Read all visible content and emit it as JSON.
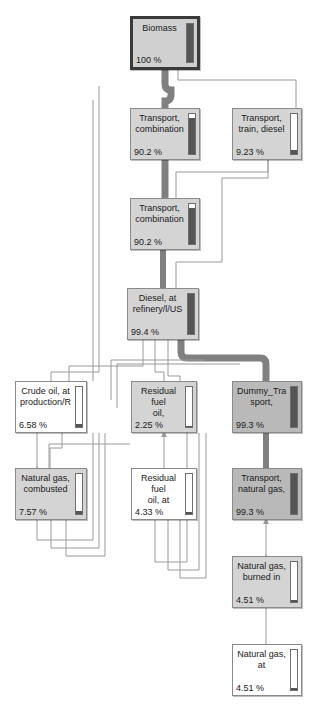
{
  "diagram": {
    "type": "lca-network-tree",
    "unit_suffix": "%",
    "colors": {
      "node_fill": "#d4d4d4",
      "node_fill_dark": "#b9b9b9",
      "node_fill_light": "#ffffff",
      "node_border": "#8a8a8a",
      "root_border": "#3a3a3a",
      "link_thin": "#9a9a9a",
      "link_thick": "#808080",
      "gauge_fill": "#555555",
      "text": "#1a1a1a"
    },
    "nodes": [
      {
        "id": "biomass",
        "line1": "Biomass",
        "line2": "",
        "pct": "100 %",
        "value": 100,
        "x": 130,
        "y": 16,
        "w": 70,
        "h": 54,
        "style": "root",
        "gauge": 100
      },
      {
        "id": "transport-combination-1",
        "line1": "Transport,",
        "line2": "combination",
        "pct": "90.2 %",
        "value": 90.2,
        "x": 130,
        "y": 108,
        "w": 70,
        "h": 52,
        "style": "normal",
        "gauge": 90
      },
      {
        "id": "transport-train-diesel",
        "line1": "Transport,",
        "line2": "train, diesel",
        "pct": "9.23 %",
        "value": 9.23,
        "x": 232,
        "y": 108,
        "w": 70,
        "h": 52,
        "style": "normal",
        "gauge": 9
      },
      {
        "id": "transport-combination-2",
        "line1": "Transport,",
        "line2": "combination",
        "pct": "90.2 %",
        "value": 90.2,
        "x": 130,
        "y": 198,
        "w": 70,
        "h": 52,
        "style": "normal",
        "gauge": 90
      },
      {
        "id": "diesel-at-refinery",
        "line1": "Diesel, at",
        "line2": "refinery/l/US",
        "pct": "99.4 %",
        "value": 99.4,
        "x": 127,
        "y": 288,
        "w": 72,
        "h": 52,
        "style": "normal",
        "gauge": 99
      },
      {
        "id": "crude-oil-at-production",
        "line1": "Crude oil, at",
        "line2": "production/R",
        "pct": "6.58 %",
        "value": 6.58,
        "x": 15,
        "y": 381,
        "w": 72,
        "h": 52,
        "style": "plain",
        "gauge": 7
      },
      {
        "id": "residual-fuel-oil",
        "line1": "Residual fuel",
        "line2": "oil,",
        "pct": "2.25 %",
        "value": 2.25,
        "x": 131,
        "y": 381,
        "w": 66,
        "h": 52,
        "style": "normal",
        "gauge": 3
      },
      {
        "id": "dummy-transport",
        "line1": "Dummy_Tran",
        "line2": "sport,",
        "pct": "99.3 %",
        "value": 99.3,
        "x": 232,
        "y": 381,
        "w": 70,
        "h": 52,
        "style": "dark",
        "gauge": 99
      },
      {
        "id": "natural-gas-combusted",
        "line1": "Natural gas,",
        "line2": "combusted",
        "pct": "7.57 %",
        "value": 7.57,
        "x": 15,
        "y": 468,
        "w": 72,
        "h": 52,
        "style": "normal",
        "gauge": 8
      },
      {
        "id": "residual-fuel-oil-at",
        "line1": "Residual fuel",
        "line2": "oil, at",
        "pct": "4.33 %",
        "value": 4.33,
        "x": 131,
        "y": 468,
        "w": 66,
        "h": 52,
        "style": "plain",
        "gauge": 5
      },
      {
        "id": "transport-natural-gas",
        "line1": "Transport,",
        "line2": "natural gas,",
        "pct": "99.3 %",
        "value": 99.3,
        "x": 232,
        "y": 468,
        "w": 70,
        "h": 52,
        "style": "dark",
        "gauge": 99
      },
      {
        "id": "natural-gas-burned-in",
        "line1": "Natural gas,",
        "line2": "burned in",
        "pct": "4.51 %",
        "value": 4.51,
        "x": 232,
        "y": 556,
        "w": 70,
        "h": 52,
        "style": "normal",
        "gauge": 5
      },
      {
        "id": "natural-gas-at",
        "line1": "Natural gas,",
        "line2": "at",
        "pct": "4.51 %",
        "value": 4.51,
        "x": 232,
        "y": 644,
        "w": 70,
        "h": 52,
        "style": "plain",
        "gauge": 5
      }
    ],
    "flows": [
      {
        "from": "transport-combination-1",
        "to": "biomass",
        "weight": "thick"
      },
      {
        "from": "transport-train-diesel",
        "to": "biomass",
        "weight": "thin"
      },
      {
        "from": "transport-combination-2",
        "to": "transport-combination-1",
        "weight": "thick"
      },
      {
        "from": "diesel-at-refinery",
        "to": "transport-combination-2",
        "weight": "thick"
      },
      {
        "from": "diesel-at-refinery",
        "to": "transport-train-diesel",
        "weight": "thin"
      },
      {
        "from": "dummy-transport",
        "to": "diesel-at-refinery",
        "weight": "thick"
      },
      {
        "from": "crude-oil-at-production",
        "to": "diesel-at-refinery",
        "weight": "thin"
      },
      {
        "from": "residual-fuel-oil",
        "to": "diesel-at-refinery",
        "weight": "thin"
      },
      {
        "from": "natural-gas-combusted",
        "to": "crude-oil-at-production",
        "weight": "thin"
      },
      {
        "from": "residual-fuel-oil-at",
        "to": "residual-fuel-oil",
        "weight": "thin"
      },
      {
        "from": "transport-natural-gas",
        "to": "dummy-transport",
        "weight": "thick"
      },
      {
        "from": "natural-gas-burned-in",
        "to": "transport-natural-gas",
        "weight": "thin"
      },
      {
        "from": "natural-gas-at",
        "to": "natural-gas-burned-in",
        "weight": "thin"
      }
    ]
  }
}
